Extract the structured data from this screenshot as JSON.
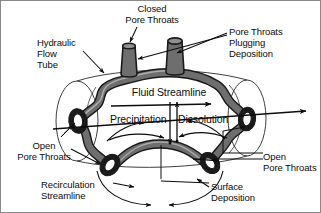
{
  "figure": {
    "background_color": "#ffffff",
    "line_color": "#0d0d0d",
    "pore_fill_color": "#6e6e6e",
    "pore_fill_light": "#9a9a9a",
    "border_color": "#8a8a8a"
  },
  "labels": {
    "closed_pore_throats": "Closed\nPore Throats",
    "pore_throats_plugging_deposition": "Pore Throats\nPlugging\nDeposition",
    "hydraulic_flow_tube": "Hydraulic\nFlow\nTube",
    "fluid_streamline": "Fluid Streamline",
    "precipitation": "Precipitation",
    "dissolution": "Dissolution",
    "open_pore_throats_left": "Open\nPore Throats",
    "open_pore_throats_right": "Open\nPore Throats",
    "recirculation_streamline": "Recirculation\nStreamline",
    "surface_deposition": "Surface\nDeposition"
  },
  "icons": {
    "leader_line": "leader-line-icon",
    "flow_arrow": "flow-arrow-icon",
    "streamline_arrow": "streamline-arrow-icon",
    "exchange_arrow": "exchange-double-arrow-icon",
    "recirculation_arrow": "recirculation-arrow-icon",
    "closed_throat": "closed-pore-throat-icon",
    "open_throat": "open-pore-throat-icon",
    "tube_body": "hydraulic-flow-tube-icon"
  }
}
